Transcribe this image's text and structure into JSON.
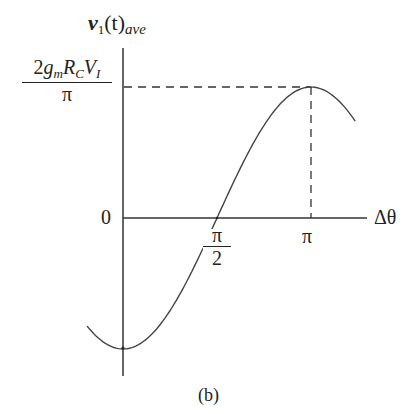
{
  "figure": {
    "caption": "(b)"
  },
  "chart_data": {
    "type": "line",
    "title": "",
    "ylabel": {
      "var": "v",
      "sub1": "1",
      "arg": "(t)",
      "sub2": "ave"
    },
    "xlabel": "Δθ",
    "function": "-A*cos(x)",
    "amplitude_label": {
      "numerator_coef": "2",
      "g": "g",
      "g_sub": "m",
      "R": "R",
      "R_sub": "C",
      "V": "V",
      "V_sub": "I",
      "denominator": "π"
    },
    "x_ticks": [
      {
        "value": 1.5708,
        "num": "π",
        "den": "2"
      },
      {
        "value": 3.1416,
        "label": "π"
      }
    ],
    "y_ticks": [
      {
        "value": 0,
        "label": "0"
      }
    ],
    "xlim": [
      -0.6,
      3.88
    ],
    "ylim": [
      -1,
      1
    ],
    "series": [
      {
        "name": "v1(t)ave",
        "x_range": [
          -0.6,
          3.88
        ],
        "peak": {
          "x": 3.1416,
          "y": 1
        },
        "min": {
          "x": 0,
          "y": -1
        },
        "zero_crossing": 1.5708
      }
    ],
    "guides": [
      {
        "type": "dashed-horizontal",
        "y": 1,
        "from_x": 0,
        "to_x": 3.1416
      },
      {
        "type": "dashed-vertical",
        "x": 3.1416,
        "from_y": 0,
        "to_y": 1
      }
    ],
    "grid": false,
    "legend": "none"
  }
}
